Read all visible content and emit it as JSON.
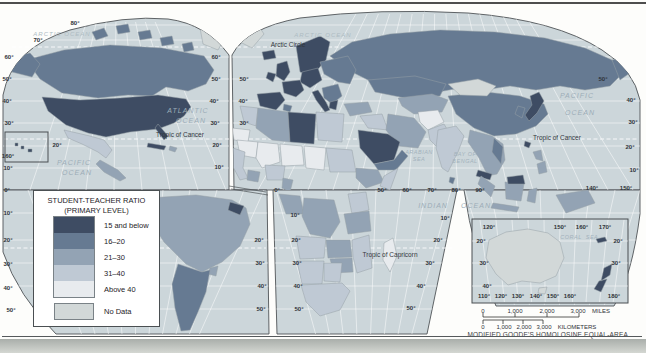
{
  "figure": {
    "caption": "MODIFIED GOODE'S HOMOLOSINE EQUAL-AREA PROJECTION"
  },
  "palette": {
    "cat1": "#3e4c63",
    "cat2": "#667a92",
    "cat3": "#93a3b4",
    "cat4": "#bfc9d4",
    "cat5": "#e8ebee",
    "no_data": "#d2d8d8",
    "ocean": "#ccd6da"
  },
  "legend": {
    "title_line1": "STUDENT-TEACHER RATIO",
    "title_line2": "(PRIMARY LEVEL)",
    "items": [
      {
        "label": "15 and below",
        "key": "cat1"
      },
      {
        "label": "16–20",
        "key": "cat2"
      },
      {
        "label": "21–30",
        "key": "cat3"
      },
      {
        "label": "31–40",
        "key": "cat4"
      },
      {
        "label": "Above 40",
        "key": "cat5"
      }
    ],
    "no_data_label": "No Data"
  },
  "map": {
    "regions": {
      "usa": "cat1",
      "florida": "cat1",
      "canada": "cat2",
      "arctic_islands": "cat2",
      "alaska": "cat2",
      "greenland_west": "no_data",
      "greenland_east": "no_data",
      "mexico": "cat4",
      "central_america": "cat3",
      "cuba": "cat1",
      "hispaniola": "cat3",
      "hawaii": "cat1",
      "south_america_north": "cat3",
      "guyanas": "cat1",
      "argentina_chile": "cat2",
      "uruguay": "cat3",
      "iceland": "cat1",
      "uk": "cat1",
      "ireland": "cat1",
      "scandinavia": "cat1",
      "denmark": "cat1",
      "iberia": "cat1",
      "france": "cat1",
      "central_europe": "cat1",
      "italy": "cat1",
      "balkans": "cat2",
      "greece": "cat1",
      "eastern_europe": "cat2",
      "russia": "cat2",
      "kamchatka": "cat2",
      "kazakhstan": "cat2",
      "central_asia": "cat3",
      "turkey": "cat3",
      "syria_iraq": "cat4",
      "iran": "cat3",
      "saudi_arabia": "cat1",
      "yemen_oman": "cat2",
      "afghanistan": "cat5",
      "pakistan": "cat4",
      "india": "cat4",
      "sri_lanka": "cat2",
      "china": "cat2",
      "mongolia": "no_data",
      "korea": "cat2",
      "japan": "cat1",
      "taiwan": "cat1",
      "philippines": "cat3",
      "se_asia": "cat3",
      "vietnam": "cat2",
      "malaysia": "cat1",
      "north_borneo": "cat1",
      "sumatra": "cat3",
      "java": "cat3",
      "borneo": "cat3",
      "sulawesi": "cat3",
      "new_guinea": "cat3",
      "west_sahara": "cat5",
      "morocco": "cat4",
      "tunisia": "cat2",
      "algeria": "cat3",
      "libya": "cat1",
      "egypt": "cat4",
      "mauritania": "cat5",
      "mali": "cat5",
      "niger": "cat5",
      "chad": "cat5",
      "sudan": "cat4",
      "senegal_guinea": "cat4",
      "ghana": "cat3",
      "nigeria": "cat4",
      "cameroon": "cat3",
      "ethiopia": "cat3",
      "somalia": "cat4",
      "gabon_congo": "cat3",
      "drc": "cat3",
      "kenya": "cat4",
      "tanzania": "cat3",
      "angola": "cat4",
      "zambia": "cat3",
      "mozambique": "cat4",
      "zimbabwe": "cat3",
      "namibia": "cat4",
      "botswana": "cat4",
      "south_africa": "cat4",
      "madagascar": "cat5",
      "australia": "no_data",
      "tasmania": "no_data",
      "new_zealand": "cat1",
      "new_caledonia": "cat1"
    }
  },
  "labels": [
    {
      "t": "80°",
      "x": 75,
      "y": 23,
      "c": "g"
    },
    {
      "t": "70°",
      "x": 38,
      "y": 40,
      "c": "g"
    },
    {
      "t": "60°",
      "x": 9,
      "y": 57,
      "c": "g"
    },
    {
      "t": "50°",
      "x": 7,
      "y": 79,
      "c": "g"
    },
    {
      "t": "40°",
      "x": 7,
      "y": 101,
      "c": "g"
    },
    {
      "t": "30°",
      "x": 9,
      "y": 123,
      "c": "g"
    },
    {
      "t": "20°",
      "x": 57,
      "y": 145,
      "c": "g"
    },
    {
      "t": "160°",
      "x": 8,
      "y": 156,
      "c": "g"
    },
    {
      "t": "10°",
      "x": 8,
      "y": 168,
      "c": "g"
    },
    {
      "t": "0°",
      "x": 7,
      "y": 190,
      "c": "g"
    },
    {
      "t": "10°",
      "x": 8,
      "y": 213,
      "c": "g"
    },
    {
      "t": "20°",
      "x": 8,
      "y": 240,
      "c": "g"
    },
    {
      "t": "30°",
      "x": 8,
      "y": 264,
      "c": "g"
    },
    {
      "t": "40°",
      "x": 8,
      "y": 288,
      "c": "g"
    },
    {
      "t": "50°",
      "x": 11,
      "y": 310,
      "c": "g"
    },
    {
      "t": "60°",
      "x": 216,
      "y": 57,
      "c": "g"
    },
    {
      "t": "50°",
      "x": 216,
      "y": 79,
      "c": "g"
    },
    {
      "t": "50°",
      "x": 244,
      "y": 79,
      "c": "g"
    },
    {
      "t": "40°",
      "x": 214,
      "y": 101,
      "c": "g"
    },
    {
      "t": "40°",
      "x": 243,
      "y": 101,
      "c": "g"
    },
    {
      "t": "30°",
      "x": 215,
      "y": 123,
      "c": "g"
    },
    {
      "t": "30°",
      "x": 244,
      "y": 123,
      "c": "g"
    },
    {
      "t": "20°",
      "x": 217,
      "y": 145,
      "c": "g"
    },
    {
      "t": "10°",
      "x": 219,
      "y": 167,
      "c": "g"
    },
    {
      "t": "0°",
      "x": 277,
      "y": 190,
      "c": "g"
    },
    {
      "t": "10°",
      "x": 295,
      "y": 215,
      "c": "g"
    },
    {
      "t": "20°",
      "x": 259,
      "y": 240,
      "c": "g"
    },
    {
      "t": "20°",
      "x": 296,
      "y": 240,
      "c": "g"
    },
    {
      "t": "30°",
      "x": 260,
      "y": 263,
      "c": "g"
    },
    {
      "t": "30°",
      "x": 297,
      "y": 263,
      "c": "g"
    },
    {
      "t": "40°",
      "x": 262,
      "y": 286,
      "c": "g"
    },
    {
      "t": "40°",
      "x": 298,
      "y": 286,
      "c": "g"
    },
    {
      "t": "50°",
      "x": 261,
      "y": 309,
      "c": "g"
    },
    {
      "t": "50°",
      "x": 299,
      "y": 309,
      "c": "g"
    },
    {
      "t": "50°",
      "x": 603,
      "y": 79,
      "c": "g"
    },
    {
      "t": "40°",
      "x": 631,
      "y": 100,
      "c": "g"
    },
    {
      "t": "30°",
      "x": 633,
      "y": 122,
      "c": "g"
    },
    {
      "t": "20°",
      "x": 630,
      "y": 147,
      "c": "g"
    },
    {
      "t": "10°",
      "x": 634,
      "y": 170,
      "c": "g"
    },
    {
      "t": "140°",
      "x": 592,
      "y": 188,
      "c": "g"
    },
    {
      "t": "150°",
      "x": 626,
      "y": 188,
      "c": "g"
    },
    {
      "t": "50°",
      "x": 382,
      "y": 190,
      "c": "g"
    },
    {
      "t": "60°",
      "x": 407,
      "y": 190,
      "c": "g"
    },
    {
      "t": "70°",
      "x": 432,
      "y": 190,
      "c": "g"
    },
    {
      "t": "80°",
      "x": 456,
      "y": 190,
      "c": "g"
    },
    {
      "t": "90°",
      "x": 480,
      "y": 190,
      "c": "g"
    },
    {
      "t": "10°",
      "x": 445,
      "y": 218,
      "c": "g"
    },
    {
      "t": "20°",
      "x": 438,
      "y": 240,
      "c": "g"
    },
    {
      "t": "30°",
      "x": 430,
      "y": 263,
      "c": "g"
    },
    {
      "t": "40°",
      "x": 421,
      "y": 286,
      "c": "g"
    },
    {
      "t": "50°",
      "x": 411,
      "y": 308,
      "c": "g"
    },
    {
      "t": "120°",
      "x": 489,
      "y": 227,
      "c": "g"
    },
    {
      "t": "150°",
      "x": 560,
      "y": 227,
      "c": "g"
    },
    {
      "t": "160°",
      "x": 582,
      "y": 227,
      "c": "g"
    },
    {
      "t": "170°",
      "x": 605,
      "y": 227,
      "c": "g"
    },
    {
      "t": "20°",
      "x": 481,
      "y": 241,
      "c": "g"
    },
    {
      "t": "30°",
      "x": 484,
      "y": 263,
      "c": "g"
    },
    {
      "t": "40°",
      "x": 487,
      "y": 286,
      "c": "g"
    },
    {
      "t": "20°",
      "x": 618,
      "y": 241,
      "c": "g"
    },
    {
      "t": "30°",
      "x": 616,
      "y": 263,
      "c": "g"
    },
    {
      "t": "110°",
      "x": 484,
      "y": 296,
      "c": "g"
    },
    {
      "t": "120°",
      "x": 501,
      "y": 296,
      "c": "g"
    },
    {
      "t": "130°",
      "x": 518,
      "y": 296,
      "c": "g"
    },
    {
      "t": "140°",
      "x": 536,
      "y": 296,
      "c": "g"
    },
    {
      "t": "150°",
      "x": 553,
      "y": 296,
      "c": "g"
    },
    {
      "t": "160°",
      "x": 570,
      "y": 296,
      "c": "g"
    },
    {
      "t": "180°",
      "x": 614,
      "y": 296,
      "c": "g"
    },
    {
      "t": "Arctic Circle",
      "x": 288,
      "y": 44,
      "c": "l"
    },
    {
      "t": "Tropic of Cancer",
      "x": 180,
      "y": 134,
      "c": "l"
    },
    {
      "t": "Tropic of Cancer",
      "x": 557,
      "y": 137,
      "c": "l"
    },
    {
      "t": "Tropic of Capricorn",
      "x": 390,
      "y": 254,
      "c": "l"
    },
    {
      "t": "ARCTIC OCEAN",
      "x": 62,
      "y": 34,
      "c": "o2"
    },
    {
      "t": "ARCTIC OCEAN",
      "x": 323,
      "y": 35,
      "c": "o2"
    },
    {
      "t": "ATLANTIC",
      "x": 188,
      "y": 110,
      "c": "o"
    },
    {
      "t": "OCEAN",
      "x": 191,
      "y": 120,
      "c": "o"
    },
    {
      "t": "PACIFIC",
      "x": 74,
      "y": 162,
      "c": "o"
    },
    {
      "t": "OCEAN",
      "x": 77,
      "y": 172,
      "c": "o"
    },
    {
      "t": "PACIFIC",
      "x": 577,
      "y": 95,
      "c": "o"
    },
    {
      "t": "OCEAN",
      "x": 580,
      "y": 112,
      "c": "o"
    },
    {
      "t": "INDIAN",
      "x": 433,
      "y": 205,
      "c": "o"
    },
    {
      "t": "OCEAN",
      "x": 476,
      "y": 205,
      "c": "o"
    },
    {
      "t": "ARABIAN",
      "x": 419,
      "y": 152,
      "c": "os"
    },
    {
      "t": "SEA",
      "x": 419,
      "y": 159,
      "c": "os"
    },
    {
      "t": "BAY OF",
      "x": 465,
      "y": 154,
      "c": "os"
    },
    {
      "t": "BENGAL",
      "x": 465,
      "y": 161,
      "c": "os"
    },
    {
      "t": "CORAL",
      "x": 571,
      "y": 237,
      "c": "os"
    },
    {
      "t": "SEA",
      "x": 592,
      "y": 237,
      "c": "os"
    },
    {
      "t": "0",
      "x": 483,
      "y": 311,
      "c": "s"
    },
    {
      "t": "1,000",
      "x": 515,
      "y": 311,
      "c": "s"
    },
    {
      "t": "2,000",
      "x": 547,
      "y": 311,
      "c": "s"
    },
    {
      "t": "3,000",
      "x": 578,
      "y": 311,
      "c": "s"
    },
    {
      "t": "MILES",
      "x": 601,
      "y": 311,
      "c": "s"
    },
    {
      "t": "0",
      "x": 483,
      "y": 327,
      "c": "s"
    },
    {
      "t": "1,000",
      "x": 504,
      "y": 327,
      "c": "s"
    },
    {
      "t": "2,000",
      "x": 524,
      "y": 327,
      "c": "s"
    },
    {
      "t": "3,000",
      "x": 544,
      "y": 327,
      "c": "s"
    },
    {
      "t": "KILOMETERS",
      "x": 577,
      "y": 327,
      "c": "s"
    }
  ]
}
